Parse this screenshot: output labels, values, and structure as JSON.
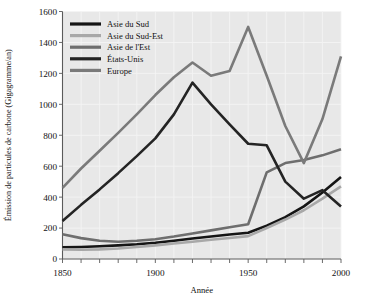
{
  "chart_data": {
    "type": "line",
    "title": "",
    "xlabel": "Année",
    "ylabel": "Émission de particules de carbone (Gigagramme/an)",
    "xlim": [
      1850,
      2000
    ],
    "ylim": [
      0,
      1600
    ],
    "ytick_labels": [
      "0",
      "200",
      "400",
      "600",
      "800",
      "1000",
      "1200",
      "1400",
      "1600"
    ],
    "ytick_values": [
      0,
      200,
      400,
      600,
      800,
      1000,
      1200,
      1400,
      1600
    ],
    "xtick_labels": [
      "1850",
      "1900",
      "1950",
      "2000"
    ],
    "xtick_values": [
      1850,
      1900,
      1950,
      2000
    ],
    "xminor_step": 10,
    "grid": true,
    "legend_position": "top-left-inside",
    "x": [
      1850,
      1860,
      1870,
      1880,
      1890,
      1900,
      1910,
      1920,
      1930,
      1940,
      1950,
      1960,
      1970,
      1980,
      1990,
      2000
    ],
    "series": [
      {
        "name": "Asie du Sud",
        "color": "#151515",
        "width": 2.6,
        "values": [
          75,
          78,
          82,
          88,
          95,
          105,
          118,
          132,
          145,
          158,
          170,
          215,
          270,
          340,
          430,
          530
        ]
      },
      {
        "name": "Asie du Sud-Est",
        "color": "#a8a8a8",
        "width": 2.6,
        "values": [
          62,
          60,
          62,
          68,
          78,
          88,
          100,
          112,
          124,
          136,
          148,
          200,
          255,
          315,
          390,
          470
        ]
      },
      {
        "name": "Asie de l'Est",
        "color": "#6e6e6e",
        "width": 2.6,
        "values": [
          160,
          135,
          118,
          112,
          118,
          128,
          145,
          165,
          185,
          205,
          225,
          560,
          620,
          640,
          670,
          710
        ]
      },
      {
        "name": "États-Unis",
        "color": "#242424",
        "width": 2.6,
        "values": [
          245,
          350,
          450,
          555,
          665,
          780,
          935,
          1140,
          1000,
          870,
          745,
          735,
          500,
          390,
          445,
          340
        ]
      },
      {
        "name": "Europe",
        "color": "#7a7a7a",
        "width": 2.6,
        "values": [
          460,
          585,
          700,
          815,
          935,
          1060,
          1175,
          1270,
          1185,
          1215,
          1500,
          1185,
          860,
          620,
          905,
          1310
        ]
      }
    ]
  },
  "legend": {
    "items": [
      {
        "label": "Asie du Sud",
        "color": "#151515"
      },
      {
        "label": "Asie du Sud-Est",
        "color": "#a8a8a8"
      },
      {
        "label": "Asie de l'Est",
        "color": "#6e6e6e"
      },
      {
        "label": "États-Unis",
        "color": "#242424"
      },
      {
        "label": "Europe",
        "color": "#7a7a7a"
      }
    ]
  }
}
